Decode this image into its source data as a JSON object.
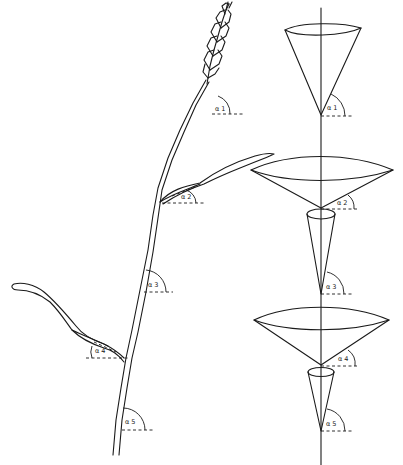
{
  "figure": {
    "type": "botanical-diagram",
    "colors": {
      "line": "#1a1a1a",
      "background": "#ffffff"
    }
  },
  "plant": {
    "name": "wheat-stem",
    "angle_labels": [
      "α 1",
      "α 2",
      "α 3",
      "α 4",
      "α 5"
    ]
  },
  "cone_model": {
    "angle_labels": [
      "α 1",
      "α 2",
      "α 3",
      "α 4",
      "α 5"
    ]
  }
}
